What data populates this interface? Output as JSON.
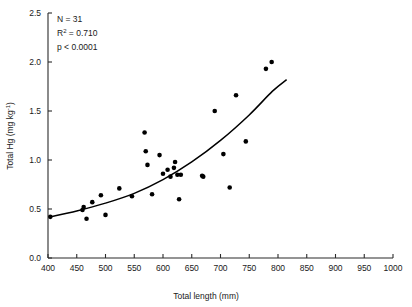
{
  "chart_data": {
    "type": "scatter",
    "title": "",
    "xlabel": "Total length (mm)",
    "ylabel": "Total Hg (mg kg-1)",
    "ylabel_base": "Total Hg (mg kg",
    "ylabel_sup": "-1",
    "ylabel_tail": ")",
    "xlim": [
      400,
      1000
    ],
    "ylim": [
      0.0,
      2.5
    ],
    "xticks": [
      400,
      450,
      500,
      550,
      600,
      650,
      700,
      750,
      800,
      850,
      900,
      950,
      1000
    ],
    "xtick_labels": [
      "400",
      "450",
      "500",
      "550",
      "600",
      "650",
      "700",
      "750",
      "800",
      "850",
      "900",
      "950",
      "1000"
    ],
    "yticks": [
      0.0,
      0.5,
      1.0,
      1.5,
      2.0,
      2.5
    ],
    "ytick_labels": [
      "0.0",
      "0.5",
      "1.0",
      "1.5",
      "2.0",
      "2.5"
    ],
    "grid": false,
    "legend": null,
    "marker": "filled-circle",
    "marker_color": "#000000",
    "points": [
      {
        "x": 404,
        "y": 0.42
      },
      {
        "x": 460,
        "y": 0.49
      },
      {
        "x": 462,
        "y": 0.52
      },
      {
        "x": 467,
        "y": 0.4
      },
      {
        "x": 477,
        "y": 0.57
      },
      {
        "x": 492,
        "y": 0.64
      },
      {
        "x": 500,
        "y": 0.44
      },
      {
        "x": 524,
        "y": 0.71
      },
      {
        "x": 546,
        "y": 0.63
      },
      {
        "x": 568,
        "y": 1.28
      },
      {
        "x": 570,
        "y": 1.09
      },
      {
        "x": 573,
        "y": 0.95
      },
      {
        "x": 581,
        "y": 0.65
      },
      {
        "x": 594,
        "y": 1.05
      },
      {
        "x": 600,
        "y": 0.86
      },
      {
        "x": 608,
        "y": 0.9
      },
      {
        "x": 613,
        "y": 0.83
      },
      {
        "x": 619,
        "y": 0.92
      },
      {
        "x": 621,
        "y": 0.98
      },
      {
        "x": 625,
        "y": 0.85
      },
      {
        "x": 628,
        "y": 0.6
      },
      {
        "x": 631,
        "y": 0.85
      },
      {
        "x": 668,
        "y": 0.84
      },
      {
        "x": 670,
        "y": 0.83
      },
      {
        "x": 690,
        "y": 1.5
      },
      {
        "x": 705,
        "y": 1.06
      },
      {
        "x": 716,
        "y": 0.72
      },
      {
        "x": 727,
        "y": 1.66
      },
      {
        "x": 744,
        "y": 1.19
      },
      {
        "x": 779,
        "y": 1.93
      },
      {
        "x": 789,
        "y": 2.0
      }
    ],
    "fit_curve": {
      "type": "exponential",
      "equation_form": "y = a*exp(b*x)",
      "x_start": 404,
      "x_end": 815,
      "y_start": 0.42,
      "y_end": 1.82,
      "path_points": [
        {
          "x": 404,
          "y": 0.42
        },
        {
          "x": 450,
          "y": 0.48
        },
        {
          "x": 500,
          "y": 0.56
        },
        {
          "x": 550,
          "y": 0.66
        },
        {
          "x": 600,
          "y": 0.8
        },
        {
          "x": 650,
          "y": 0.98
        },
        {
          "x": 700,
          "y": 1.2
        },
        {
          "x": 750,
          "y": 1.46
        },
        {
          "x": 790,
          "y": 1.7
        },
        {
          "x": 815,
          "y": 1.82
        }
      ]
    },
    "annotations": [
      {
        "id": "sample-size",
        "text": "N = 31"
      },
      {
        "id": "r-squared",
        "text": "R2 = 0.710",
        "base": "R",
        "sup": "2",
        "tail": " = 0.710"
      },
      {
        "id": "p-value",
        "text": "p < 0.0001"
      }
    ]
  }
}
